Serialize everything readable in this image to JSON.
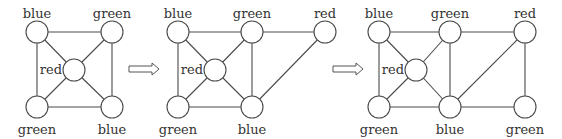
{
  "figure": {
    "colors": {
      "line": "#4a4a4a",
      "text": "#333333",
      "background": "#ffffff"
    },
    "node_radius": 11
  },
  "graphs": [
    {
      "id": "graph-1",
      "nodes": [
        {
          "id": "a",
          "x": 37,
          "y": 32,
          "label": "blue",
          "lx": 37,
          "ly": 18,
          "anchor": "middle"
        },
        {
          "id": "b",
          "x": 112,
          "y": 32,
          "label": "green",
          "lx": 112,
          "ly": 18,
          "anchor": "middle"
        },
        {
          "id": "c",
          "x": 74,
          "y": 70,
          "label": "red",
          "lx": 62,
          "ly": 74,
          "anchor": "end"
        },
        {
          "id": "d",
          "x": 37,
          "y": 107,
          "label": "green",
          "lx": 37,
          "ly": 134,
          "anchor": "middle"
        },
        {
          "id": "e",
          "x": 112,
          "y": 107,
          "label": "blue",
          "lx": 112,
          "ly": 134,
          "anchor": "middle"
        }
      ],
      "edges": [
        [
          "a",
          "b"
        ],
        [
          "a",
          "d"
        ],
        [
          "b",
          "e"
        ],
        [
          "d",
          "e"
        ],
        [
          "a",
          "c"
        ],
        [
          "b",
          "c"
        ],
        [
          "d",
          "c"
        ],
        [
          "e",
          "c"
        ]
      ]
    },
    {
      "id": "graph-2",
      "nodes": [
        {
          "id": "a",
          "x": 178,
          "y": 32,
          "label": "blue",
          "lx": 178,
          "ly": 18,
          "anchor": "middle"
        },
        {
          "id": "b",
          "x": 252,
          "y": 32,
          "label": "green",
          "lx": 252,
          "ly": 18,
          "anchor": "middle"
        },
        {
          "id": "f",
          "x": 325,
          "y": 32,
          "label": "red",
          "lx": 325,
          "ly": 18,
          "anchor": "middle"
        },
        {
          "id": "c",
          "x": 215,
          "y": 70,
          "label": "red",
          "lx": 203,
          "ly": 74,
          "anchor": "end"
        },
        {
          "id": "d",
          "x": 178,
          "y": 107,
          "label": "green",
          "lx": 178,
          "ly": 134,
          "anchor": "middle"
        },
        {
          "id": "e",
          "x": 252,
          "y": 107,
          "label": "blue",
          "lx": 252,
          "ly": 134,
          "anchor": "middle"
        }
      ],
      "edges": [
        [
          "a",
          "b"
        ],
        [
          "b",
          "f"
        ],
        [
          "a",
          "d"
        ],
        [
          "b",
          "e"
        ],
        [
          "d",
          "e"
        ],
        [
          "a",
          "c"
        ],
        [
          "b",
          "c"
        ],
        [
          "d",
          "c"
        ],
        [
          "e",
          "c"
        ],
        [
          "e",
          "f"
        ]
      ]
    },
    {
      "id": "graph-3",
      "nodes": [
        {
          "id": "a",
          "x": 379,
          "y": 32,
          "label": "blue",
          "lx": 379,
          "ly": 18,
          "anchor": "middle"
        },
        {
          "id": "b",
          "x": 450,
          "y": 32,
          "label": "green",
          "lx": 450,
          "ly": 18,
          "anchor": "middle"
        },
        {
          "id": "f",
          "x": 525,
          "y": 32,
          "label": "red",
          "lx": 525,
          "ly": 18,
          "anchor": "middle"
        },
        {
          "id": "c",
          "x": 416,
          "y": 70,
          "label": "red",
          "lx": 404,
          "ly": 74,
          "anchor": "end"
        },
        {
          "id": "d",
          "x": 379,
          "y": 107,
          "label": "green",
          "lx": 379,
          "ly": 134,
          "anchor": "middle"
        },
        {
          "id": "e",
          "x": 450,
          "y": 107,
          "label": "blue",
          "lx": 450,
          "ly": 134,
          "anchor": "middle"
        },
        {
          "id": "g",
          "x": 525,
          "y": 107,
          "label": "green",
          "lx": 525,
          "ly": 134,
          "anchor": "middle"
        }
      ],
      "edges": [
        [
          "a",
          "b"
        ],
        [
          "b",
          "f"
        ],
        [
          "a",
          "d"
        ],
        [
          "b",
          "e"
        ],
        [
          "d",
          "e"
        ],
        [
          "a",
          "c"
        ],
        [
          "b",
          "c"
        ],
        [
          "d",
          "c"
        ],
        [
          "e",
          "c"
        ],
        [
          "e",
          "f"
        ],
        [
          "f",
          "g"
        ],
        [
          "e",
          "g"
        ]
      ]
    }
  ],
  "arrows": [
    {
      "id": "arrow-1",
      "x1": 129,
      "x2": 159,
      "y": 69
    },
    {
      "id": "arrow-2",
      "x1": 333,
      "x2": 363,
      "y": 69
    }
  ]
}
